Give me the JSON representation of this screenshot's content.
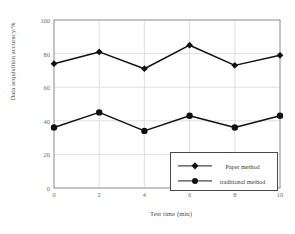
{
  "chart_data": {
    "type": "line",
    "title": "",
    "xlabel": "Test time (min)",
    "ylabel": "Data acquisition accuracy/%",
    "x": [
      0,
      2,
      4,
      6,
      8,
      10
    ],
    "xticks": [
      "0",
      "2",
      "4",
      "6",
      "8",
      "10"
    ],
    "yticks": [
      "0",
      "20",
      "40",
      "60",
      "80",
      "100"
    ],
    "xlim": [
      0,
      10
    ],
    "ylim": [
      0,
      100
    ],
    "grid": true,
    "legend_position": "lower right",
    "series": [
      {
        "name": "Paper method",
        "marker": "diamond",
        "color": "#111111",
        "values": [
          74,
          81,
          71,
          85,
          73,
          79
        ]
      },
      {
        "name": "traditional method",
        "marker": "circle",
        "color": "#111111",
        "values": [
          36,
          45,
          34,
          43,
          36,
          43
        ]
      }
    ]
  },
  "legend": {
    "items": [
      {
        "label": "Paper method"
      },
      {
        "label": "traditional method"
      }
    ]
  },
  "axes": {
    "x_title": "Test time (min)",
    "y_title": "Data acquisition accuracy/%"
  },
  "colors": {
    "line": "#111111",
    "frame": "#777777",
    "grid": "#d8d8d8",
    "tick_text": "#6a6a6a",
    "title_text": "#4a4a4a",
    "legend_border": "#4a4a4a",
    "background": "#ffffff"
  }
}
